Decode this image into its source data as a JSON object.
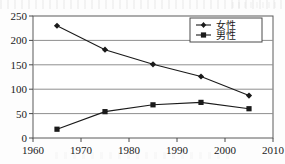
{
  "chart_data": {
    "type": "line",
    "title": "",
    "subtitle": "",
    "xlabel": "",
    "ylabel": "",
    "x": [
      1965,
      1975,
      1985,
      1995,
      2005
    ],
    "xlim": [
      1960,
      2010
    ],
    "ylim": [
      0,
      250
    ],
    "x_ticks": [
      1960,
      1970,
      1980,
      1990,
      2000,
      2010
    ],
    "x_tick_labels": [
      "1960",
      "1970",
      "1980",
      "1990",
      "2000",
      "2010"
    ],
    "y_ticks": [
      0,
      50,
      100,
      150,
      200,
      250
    ],
    "y_tick_labels": [
      "0",
      "50",
      "100",
      "150",
      "200",
      "250"
    ],
    "grid": "horizontal",
    "legend_position": "top-right",
    "series": [
      {
        "name": "女性",
        "marker": "diamond",
        "color": "#1a1a1a",
        "values": [
          230,
          181,
          151,
          126,
          87
        ]
      },
      {
        "name": "男性",
        "marker": "square",
        "color": "#1a1a1a",
        "values": [
          18,
          54,
          68,
          73,
          60
        ]
      }
    ],
    "annotations": []
  },
  "axes": {
    "y_labels": [
      "250",
      "200",
      "150",
      "100",
      "50",
      "0"
    ],
    "x_labels": [
      "1960",
      "1970",
      "1980",
      "1990",
      "2000",
      "2010"
    ]
  },
  "legend": {
    "entries": [
      {
        "label": "女性",
        "marker": "diamond-marker-icon"
      },
      {
        "label": "男性",
        "marker": "square-marker-icon"
      }
    ]
  },
  "colors": {
    "line": "#1a1a1a",
    "grid": "#8c8c8c",
    "axis": "#555555",
    "background": "#fdfdfd"
  }
}
